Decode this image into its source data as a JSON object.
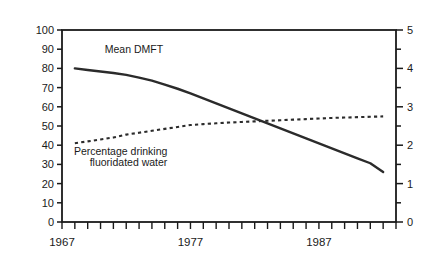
{
  "chart_data": {
    "type": "line",
    "title": "",
    "xlabel": "Year",
    "ylabel": "Percentage drinking fluoridated water",
    "ylabel_right": "Mean DMFT",
    "xlim": [
      1967,
      1993
    ],
    "ylim": [
      0,
      100
    ],
    "ylim_right": [
      0,
      5
    ],
    "grid": false,
    "legend": "none (inline annotations)",
    "xticks": [
      1967,
      1968,
      1969,
      1970,
      1971,
      1972,
      1973,
      1974,
      1975,
      1976,
      1977,
      1978,
      1979,
      1980,
      1981,
      1982,
      1983,
      1984,
      1985,
      1986,
      1987,
      1988,
      1989,
      1990,
      1991,
      1992,
      1993
    ],
    "xtick_labels": [
      "1967",
      "1977",
      "1987"
    ],
    "xtick_label_values": [
      1967,
      1977,
      1987
    ],
    "yticks_left": [
      0,
      10,
      20,
      30,
      40,
      50,
      60,
      70,
      80,
      90,
      100
    ],
    "ytick_labels_left": [
      "0",
      "10",
      "20",
      "30",
      "40",
      "50",
      "60",
      "70",
      "80",
      "90",
      "100"
    ],
    "yticks_right": [
      0,
      1,
      2,
      3,
      4,
      5
    ],
    "ytick_labels_right": [
      "0",
      "1",
      "2",
      "3",
      "4",
      "5"
    ],
    "yticks_right_minor": [
      0.5,
      1.5,
      2.5,
      3.5,
      4.5
    ],
    "series": [
      {
        "name": "Mean DMFT",
        "axis": "right",
        "style": "solid",
        "color": "#2b2b2b",
        "x": [
          1968,
          1969,
          1970,
          1971,
          1972,
          1973,
          1974,
          1975,
          1976,
          1977,
          1978,
          1979,
          1980,
          1981,
          1982,
          1983,
          1984,
          1985,
          1986,
          1987,
          1988,
          1989,
          1990,
          1991,
          1992
        ],
        "values": [
          4.0,
          3.96,
          3.92,
          3.88,
          3.83,
          3.76,
          3.68,
          3.58,
          3.47,
          3.35,
          3.22,
          3.09,
          2.96,
          2.83,
          2.7,
          2.57,
          2.44,
          2.31,
          2.18,
          2.05,
          1.92,
          1.79,
          1.66,
          1.53,
          1.3
        ],
        "values_left_scale_equivalent": [
          80,
          79,
          78,
          77,
          76.5,
          75,
          73.5,
          71.5,
          69.5,
          67,
          64.5,
          62,
          59,
          56.5,
          54,
          51.5,
          49,
          46,
          43.5,
          41,
          38.5,
          36,
          33,
          30.5,
          26
        ]
      },
      {
        "name": "Percentage drinking fluoridated water",
        "axis": "left",
        "style": "dotted",
        "color": "#2b2b2b",
        "x": [
          1968,
          1969,
          1970,
          1971,
          1972,
          1973,
          1974,
          1975,
          1976,
          1977,
          1978,
          1979,
          1980,
          1981,
          1982,
          1983,
          1984,
          1985,
          1986,
          1987,
          1988,
          1989,
          1990,
          1991,
          1992
        ],
        "values": [
          41,
          42,
          43,
          44,
          45.5,
          46.5,
          47.5,
          48.5,
          49.5,
          50.5,
          51,
          51.4,
          51.8,
          52.1,
          52.4,
          52.7,
          53.0,
          53.3,
          53.6,
          53.9,
          54.2,
          54.4,
          54.6,
          54.8,
          55
        ]
      }
    ],
    "annotations": [
      {
        "text": "Mean DMFT",
        "x": 1972.6,
        "y": 88
      },
      {
        "text": "Percentage drinking",
        "x": 1975.2,
        "y": 35
      },
      {
        "text": "fluoridated water",
        "x": 1975.2,
        "y": 29
      }
    ]
  },
  "labels": {
    "y_left_title": "Percentage drinking fluoridated water",
    "y_right_title": "Mean DMFT",
    "x_title": "Year"
  },
  "colors": {
    "axis": "#1a1a1a",
    "line": "#2b2b2b",
    "background": "#ffffff"
  }
}
